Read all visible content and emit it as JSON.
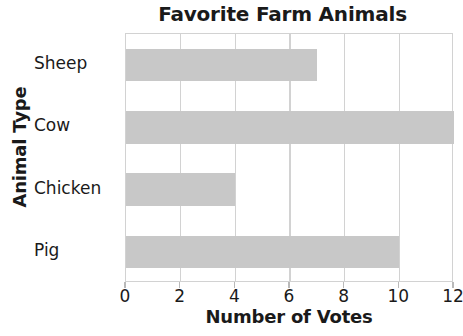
{
  "chart_data": {
    "type": "bar",
    "orientation": "horizontal",
    "title": "Favorite Farm Animals",
    "xlabel": "Number of Votes",
    "ylabel": "Animal Type",
    "categories": [
      "Sheep",
      "Cow",
      "Chicken",
      "Pig"
    ],
    "values": [
      7,
      12,
      4,
      10
    ],
    "xlim": [
      0,
      12
    ],
    "xticks": [
      0,
      2,
      4,
      6,
      8,
      10,
      12
    ],
    "xtick_labels": [
      "0",
      "2",
      "4",
      "6",
      "8",
      "10",
      "12"
    ],
    "grid": true,
    "legend": false,
    "bar_color": "#c8c8c8",
    "grid_color": "#d2d2d2",
    "text_color": "#1a1a1a"
  }
}
